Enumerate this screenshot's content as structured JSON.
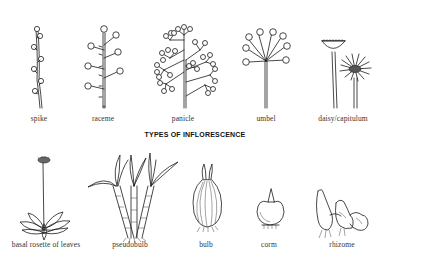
{
  "title": "TYPES OF INFLORESCENCE",
  "inflorescence": [
    {
      "label": "spike",
      "icon": "spike-icon",
      "x": 39,
      "y": 114
    },
    {
      "label": "raceme",
      "icon": "raceme-icon",
      "x": 103,
      "y": 114
    },
    {
      "label": "panicle",
      "icon": "panicle-icon",
      "x": 183,
      "y": 114
    },
    {
      "label": "umbel",
      "icon": "umbel-icon",
      "x": 266,
      "y": 114
    },
    {
      "label": "daisy/capitulum",
      "icon": "daisy-capitulum-icon",
      "x": 343,
      "y": 114
    }
  ],
  "growth_forms": [
    {
      "label": "basal rosette of leaves",
      "icon": "basal-rosette-icon",
      "x": 46,
      "y": 240
    },
    {
      "label": "pseudobulb",
      "icon": "pseudobulb-icon",
      "x": 130,
      "y": 240
    },
    {
      "label": "bulb",
      "icon": "bulb-icon",
      "x": 206,
      "y": 240
    },
    {
      "label": "corm",
      "icon": "corm-icon",
      "x": 269,
      "y": 240
    },
    {
      "label": "rhizome",
      "icon": "rhizome-icon",
      "x": 342,
      "y": 240
    }
  ],
  "title_pos": {
    "x": 195,
    "y": 131
  },
  "colors": {
    "ink": "#1a1a1a",
    "background": "#ffffff",
    "label": "#333333"
  }
}
